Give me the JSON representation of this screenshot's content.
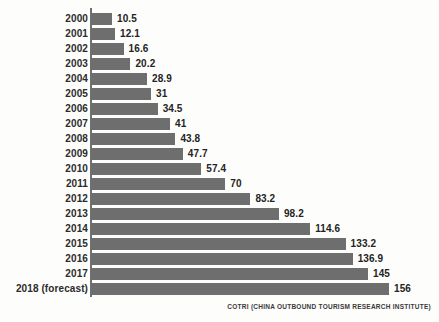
{
  "chart_data": {
    "type": "bar",
    "orientation": "horizontal",
    "title": "",
    "subtitle": "",
    "xlabel": "",
    "ylabel": "",
    "grid": false,
    "legend": null,
    "xlim": [
      0,
      156
    ],
    "categories": [
      "2000",
      "2001",
      "2002",
      "2003",
      "2004",
      "2005",
      "2006",
      "2007",
      "2008",
      "2009",
      "2010",
      "2011",
      "2012",
      "2013",
      "2014",
      "2015",
      "2016",
      "2017",
      "2018 (forecast)"
    ],
    "values": [
      10.5,
      12.1,
      16.6,
      20.2,
      28.9,
      31,
      34.5,
      41,
      43.8,
      47.7,
      57.4,
      70,
      83.2,
      98.2,
      114.6,
      133.2,
      136.9,
      145,
      156
    ],
    "value_labels": [
      "10.5",
      "12.1",
      "16.6",
      "20.2",
      "28.9",
      "31",
      "34.5",
      "41",
      "43.8",
      "47.7",
      "57.4",
      "70",
      "83.2",
      "98.2",
      "114.6",
      "133.2",
      "136.9",
      "145",
      "156"
    ],
    "bar_color": "#6e6e6e",
    "axis_color": "#6f6f6f",
    "background_color": "#fdfdfb"
  },
  "footer": {
    "source": "COTRI (CHINA OUTBOUND TOURISM RESEARCH INSTITUTE)"
  }
}
